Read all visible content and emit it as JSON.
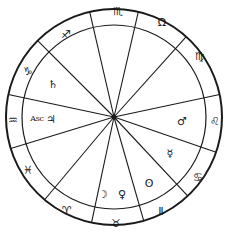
{
  "chart": {
    "center": [
      114,
      117
    ],
    "outer_radius": 108,
    "inner_radius": 92,
    "stroke_color": "#1a1a1a",
    "background": "#ffffff"
  },
  "cusp_angles_deg": [
    -103,
    -77,
    -48,
    -12,
    19,
    47,
    74,
    102,
    130,
    163,
    192,
    225
  ],
  "signs": [
    {
      "name": "scorpio",
      "glyph": "♏",
      "x": 118,
      "y": 11
    },
    {
      "name": "libra",
      "glyph": "Ω",
      "x": 162,
      "y": 22
    },
    {
      "name": "virgo",
      "glyph": "♍",
      "x": 200,
      "y": 56
    },
    {
      "name": "leo",
      "glyph": "♌",
      "x": 215,
      "y": 121
    },
    {
      "name": "cancer",
      "glyph": "♋",
      "x": 198,
      "y": 177
    },
    {
      "name": "gemini",
      "glyph": "Ⅱ",
      "x": 161,
      "y": 211
    },
    {
      "name": "taurus",
      "glyph": "♉",
      "x": 116,
      "y": 223
    },
    {
      "name": "aries",
      "glyph": "♈",
      "x": 67,
      "y": 210
    },
    {
      "name": "pisces",
      "glyph": "♓",
      "x": 28,
      "y": 170
    },
    {
      "name": "aquarius",
      "glyph": "♒",
      "x": 13,
      "y": 120
    },
    {
      "name": "capricorn",
      "glyph": "♑",
      "x": 28,
      "y": 71
    },
    {
      "name": "sagittarius",
      "glyph": "♐",
      "x": 66,
      "y": 34
    }
  ],
  "planets": [
    {
      "name": "saturn",
      "glyph": "♄",
      "x": 53,
      "y": 84
    },
    {
      "name": "jupiter",
      "glyph": "♃",
      "x": 51,
      "y": 119
    },
    {
      "name": "mars",
      "glyph": "♂",
      "x": 182,
      "y": 121
    },
    {
      "name": "mercury",
      "glyph": "☿",
      "x": 170,
      "y": 153
    },
    {
      "name": "sun",
      "glyph": "ʘ",
      "x": 149,
      "y": 183
    },
    {
      "name": "venus",
      "glyph": "♀",
      "x": 122,
      "y": 194
    },
    {
      "name": "moon",
      "glyph": "☽",
      "x": 103,
      "y": 194
    }
  ],
  "ascendant": {
    "label": "Asc",
    "x": 37,
    "y": 119
  }
}
